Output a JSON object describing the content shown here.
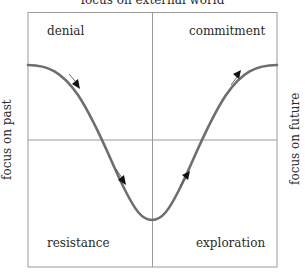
{
  "diagram": {
    "top_label": "focus on external world",
    "left_label": "focus on past",
    "right_label": "focus on future",
    "quadrants": {
      "top_left": "denial",
      "top_right": "commitment",
      "bottom_left": "resistance",
      "bottom_right": "exploration"
    },
    "colors": {
      "frame": "#9a9a9a",
      "curve": "#6e6e6e",
      "arrow": "#1a1a1a",
      "text": "#2a2a2a"
    },
    "curve_description": "U-shaped change curve descending from denial through resistance to a minimum, then rising through exploration to commitment",
    "arrows": [
      {
        "position": "denial",
        "direction": "down-right"
      },
      {
        "position": "resistance",
        "direction": "down-right"
      },
      {
        "position": "exploration",
        "direction": "up-right"
      },
      {
        "position": "commitment",
        "direction": "up-right"
      }
    ]
  }
}
